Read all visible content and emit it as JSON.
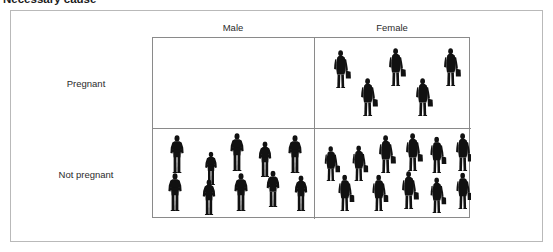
{
  "heading": {
    "text": "Necessary cause",
    "note": "clipped at top edge of screenshot"
  },
  "figure": {
    "type": "2x2-contingency-pictogram",
    "columns": [
      {
        "key": "male",
        "label": "Male"
      },
      {
        "key": "female",
        "label": "Female"
      }
    ],
    "rows": [
      {
        "key": "pregnant",
        "label": "Pregnant"
      },
      {
        "key": "not_pregnant",
        "label": "Not pregnant"
      }
    ],
    "cells": [
      {
        "row": "pregnant",
        "column": "male",
        "count": 0,
        "icon": "person-male-icon",
        "people": []
      },
      {
        "row": "pregnant",
        "column": "female",
        "count": 5,
        "icon": "person-female-icon",
        "people": [
          {
            "x": 18,
            "y": 12,
            "scale": 1.0
          },
          {
            "x": 73,
            "y": 10,
            "scale": 1.0
          },
          {
            "x": 128,
            "y": 10,
            "scale": 1.0
          },
          {
            "x": 45,
            "y": 40,
            "scale": 1.0
          },
          {
            "x": 100,
            "y": 40,
            "scale": 1.0
          }
        ]
      },
      {
        "row": "not_pregnant",
        "column": "male",
        "count": 10,
        "icon": "person-male-icon",
        "people": [
          {
            "x": 16,
            "y": 6,
            "scale": 1.0
          },
          {
            "x": 50,
            "y": 18,
            "scale": 0.88
          },
          {
            "x": 76,
            "y": 4,
            "scale": 1.0
          },
          {
            "x": 104,
            "y": 10,
            "scale": 0.94
          },
          {
            "x": 134,
            "y": 6,
            "scale": 1.0
          },
          {
            "x": 14,
            "y": 44,
            "scale": 1.0
          },
          {
            "x": 48,
            "y": 48,
            "scale": 0.94
          },
          {
            "x": 80,
            "y": 44,
            "scale": 1.0
          },
          {
            "x": 112,
            "y": 40,
            "scale": 0.96
          },
          {
            "x": 140,
            "y": 44,
            "scale": 0.94
          }
        ]
      },
      {
        "row": "not_pregnant",
        "column": "female",
        "count": 11,
        "icon": "person-female-icon",
        "people": [
          {
            "x": 8,
            "y": 14,
            "scale": 0.92
          },
          {
            "x": 36,
            "y": 14,
            "scale": 0.94
          },
          {
            "x": 63,
            "y": 6,
            "scale": 1.0
          },
          {
            "x": 90,
            "y": 4,
            "scale": 1.0
          },
          {
            "x": 114,
            "y": 6,
            "scale": 0.96
          },
          {
            "x": 140,
            "y": 4,
            "scale": 1.0
          },
          {
            "x": 22,
            "y": 44,
            "scale": 0.96
          },
          {
            "x": 56,
            "y": 44,
            "scale": 0.96
          },
          {
            "x": 86,
            "y": 42,
            "scale": 1.0
          },
          {
            "x": 114,
            "y": 46,
            "scale": 0.94
          },
          {
            "x": 140,
            "y": 42,
            "scale": 0.96
          }
        ]
      }
    ]
  },
  "colors": {
    "silhouette": "#111111",
    "grid_line": "#8a8a8a",
    "outer_frame": "#b9b9b9",
    "top_bar": "#1a1a1a",
    "text": "#2b2b2b",
    "background": "#ffffff"
  }
}
